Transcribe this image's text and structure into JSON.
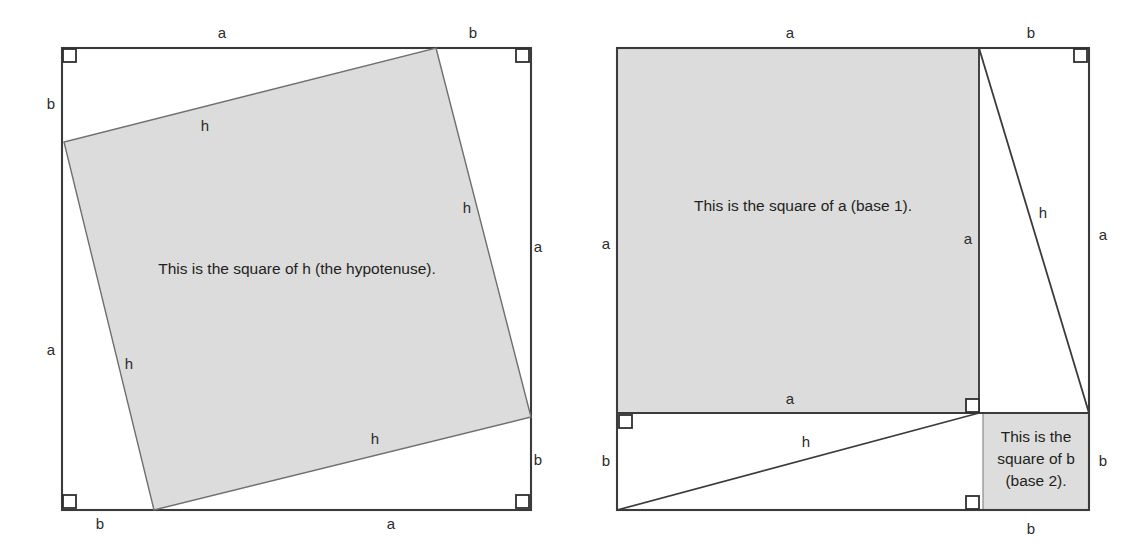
{
  "figure": {
    "colors": {
      "shade_fill": "#dcdcdc",
      "outline_stroke": "#3b3b3b",
      "text": "#231f20",
      "background": "#ffffff"
    }
  },
  "left_panel": {
    "name": "square-of-hypotenuse-panel",
    "caption": "This is the square of h (the hypotenuse).",
    "outer_square": {
      "top_left": [
        62,
        48
      ],
      "bottom_right": [
        531,
        510
      ],
      "edge_labels": {
        "top_left_segment": "a",
        "top_right_segment": "b",
        "right_top_segment": "a",
        "right_bottom_segment": "b",
        "bottom_left_segment": "b",
        "bottom_right_segment": "a",
        "left_top_segment": "b",
        "left_bottom_segment": "a"
      }
    },
    "tilted_square": {
      "vertices": [
        [
          436,
          48
        ],
        [
          531,
          417
        ],
        [
          154,
          510
        ],
        [
          64,
          142
        ]
      ],
      "side_labels": [
        "h",
        "h",
        "h",
        "h"
      ],
      "label_positions": {
        "top": "h",
        "right": "h",
        "bottom": "h",
        "left": "h"
      }
    },
    "right_angle_markers": 4
  },
  "right_panel": {
    "name": "squares-of-legs-panel",
    "caption_square_a": "This is the square of a (base 1).",
    "caption_square_b_lines": [
      "This is the",
      "square of b",
      "(base 2)."
    ],
    "outer_square": {
      "top_left": [
        617,
        48
      ],
      "bottom_right": [
        1089,
        510
      ]
    },
    "divider_vertical_x": 979,
    "divider_horizontal_y": 413,
    "square_b_left_x": 983,
    "edge_labels": {
      "top_left_segment": "a",
      "top_right_segment": "b",
      "right_top_segment": "a",
      "right_bottom_segment": "b",
      "bottom_segment": "b",
      "left_top_segment": "a",
      "left_bottom_segment": "b",
      "inner_vertical_segment": "a",
      "inner_horizontal_segment": "a",
      "hypotenuse_upper": "h",
      "hypotenuse_lower": "h"
    },
    "right_angle_markers": 4
  },
  "letters": {
    "a": "a",
    "b": "b",
    "h": "h"
  }
}
